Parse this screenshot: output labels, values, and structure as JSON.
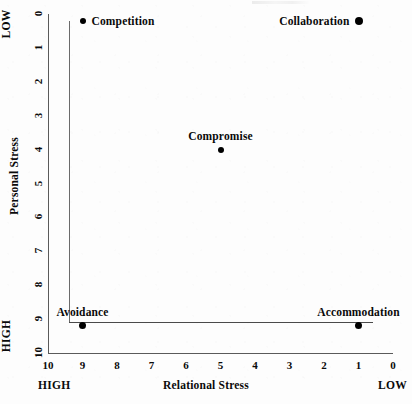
{
  "chart_data": {
    "type": "scatter",
    "title": "",
    "xlabel": "Relational Stress",
    "ylabel": "Personal Stress",
    "xlim": [
      10,
      0
    ],
    "ylim": [
      0,
      10
    ],
    "grid": false,
    "legend": "none",
    "x_ticks": [
      "10",
      "9",
      "8",
      "7",
      "6",
      "5",
      "4",
      "3",
      "2",
      "1",
      "0"
    ],
    "y_ticks": [
      "0",
      "1",
      "2",
      "3",
      "4",
      "5",
      "6",
      "7",
      "8",
      "9",
      "10"
    ],
    "x_axis_end_markers": {
      "left": "HIGH",
      "right": "LOW"
    },
    "y_axis_end_markers": {
      "top": "LOW",
      "bottom": "HIGH"
    },
    "points": [
      {
        "label": "Competition",
        "x": 9,
        "y": 0.2,
        "label_position": "right",
        "dot_size": 6
      },
      {
        "label": "Collaboration",
        "x": 1,
        "y": 0.2,
        "label_position": "left",
        "dot_size": 8
      },
      {
        "label": "Compromise",
        "x": 5,
        "y": 4.0,
        "label_position": "above",
        "dot_size": 6
      },
      {
        "label": "Avoidance",
        "x": 9,
        "y": 9.2,
        "label_position": "above",
        "dot_size": 7
      },
      {
        "label": "Accommodation",
        "x": 1,
        "y": 9.2,
        "label_position": "above",
        "dot_size": 7
      }
    ],
    "connectors": [
      {
        "from": "Competition",
        "to": "Avoidance",
        "orientation": "vertical"
      },
      {
        "from": "Avoidance",
        "to": "Accommodation",
        "orientation": "horizontal"
      }
    ],
    "colors": {
      "point": "#000000",
      "axis": "#5a5a5a",
      "connector": "#4a4a4a",
      "text": "#0a0a0a",
      "background": "#fdfdfd"
    }
  }
}
